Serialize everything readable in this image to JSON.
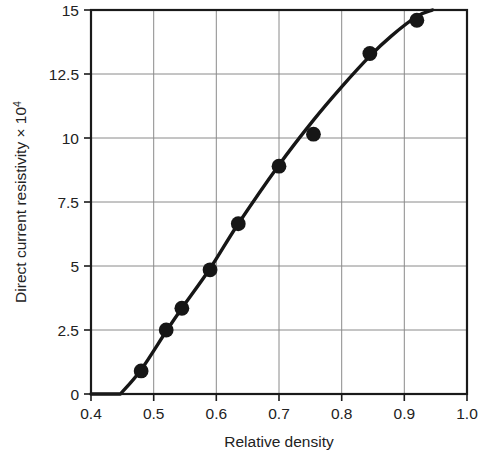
{
  "chart_data": {
    "type": "line",
    "title": "",
    "xlabel": "Relative density",
    "ylabel": "Direct current resistivity × 10",
    "ylabel_base": "Direct current resistivity",
    "ylabel_multiplier_mantissa": "× 10",
    "ylabel_multiplier_exponent": "4",
    "xlim": [
      0.4,
      1.0
    ],
    "ylim": [
      0,
      15
    ],
    "xticks": [
      0.4,
      0.5,
      0.6,
      0.7,
      0.8,
      0.9,
      1.0
    ],
    "xtick_labels": [
      "0.4",
      "0.5",
      "0.6",
      "0.7",
      "0.8",
      "0.9",
      "1.0"
    ],
    "yticks": [
      0,
      2.5,
      5,
      7.5,
      10,
      12.5,
      15
    ],
    "ytick_labels": [
      "0",
      "2.5",
      "5",
      "7.5",
      "10",
      "12.5",
      "15"
    ],
    "grid": true,
    "grid_color": "#8a8a8a",
    "legend": null,
    "legend_position": "none",
    "line_color": "#161616",
    "marker_color": "#161616",
    "marker": "circle",
    "series": [
      {
        "name": "Direct current resistivity",
        "x": [
          0.48,
          0.52,
          0.545,
          0.59,
          0.635,
          0.7,
          0.755,
          0.845,
          0.92
        ],
        "values": [
          0.9,
          2.5,
          3.35,
          4.85,
          6.65,
          8.9,
          10.15,
          13.3,
          14.6
        ]
      }
    ],
    "fit_curve": {
      "name": "smooth trend curve",
      "x": [
        0.447,
        0.48,
        0.52,
        0.545,
        0.59,
        0.635,
        0.7,
        0.755,
        0.8,
        0.845,
        0.88,
        0.92,
        0.945
      ],
      "values": [
        0.0,
        0.95,
        2.45,
        3.35,
        4.9,
        6.65,
        8.95,
        10.7,
        12.0,
        13.2,
        14.0,
        14.75,
        15.0
      ]
    }
  }
}
